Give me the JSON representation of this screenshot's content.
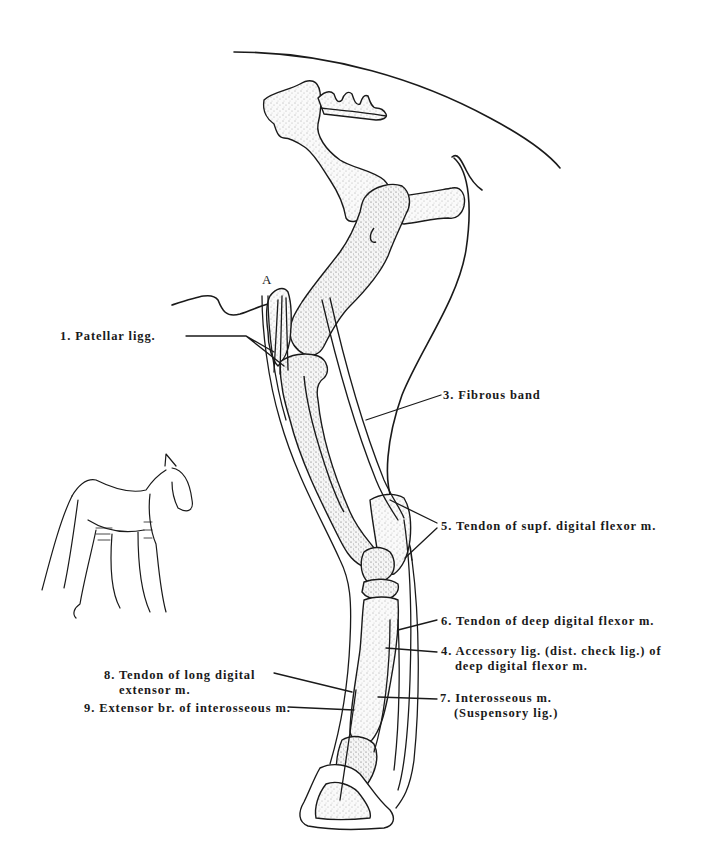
{
  "figure": {
    "reference_marker": "A",
    "inset": "horse-sketch-with-highlighted-limbs"
  },
  "labels": [
    {
      "id": "1",
      "text": "1. Patellar ligg."
    },
    {
      "id": "3",
      "text": "3. Fibrous band"
    },
    {
      "id": "5",
      "text": "5. Tendon of supf. digital flexor m."
    },
    {
      "id": "6",
      "text": "6. Tendon of deep digital flexor m."
    },
    {
      "id": "4",
      "line1": "4. Accessory lig. (dist. check lig.) of",
      "line2": "deep digital flexor m."
    },
    {
      "id": "7",
      "line1": "7. Interosseous m.",
      "line2": "(Suspensory lig.)"
    },
    {
      "id": "8",
      "line1": "8. Tendon of long digital",
      "line2": "extensor m."
    },
    {
      "id": "9",
      "text": "9. Extensor br. of interosseous m."
    }
  ],
  "colors": {
    "ink": "#1a1a1a",
    "bone_fill": "#f4f4f4",
    "paper": "#ffffff"
  }
}
